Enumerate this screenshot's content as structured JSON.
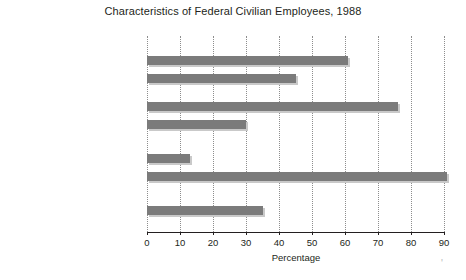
{
  "chart_data": {
    "type": "bar",
    "orientation": "horizontal",
    "title": "Characteristics of Federal Civilian Employees, 1988",
    "xlabel": "Percentage",
    "ylabel": "",
    "xlim": [
      0,
      90
    ],
    "xticks": [
      0,
      10,
      20,
      30,
      40,
      50,
      60,
      70,
      80,
      90
    ],
    "xtick_labels": [
      "0",
      "10",
      "20",
      "30",
      "40",
      "50",
      "60",
      "70",
      "80",
      "90"
    ],
    "grid": "vertical-dotted",
    "legend": "none",
    "categories": [
      "Male",
      "Female",
      "White",
      "Minority",
      "Located in Washington, D.C.",
      "Located Elsewhere",
      "College Graduates"
    ],
    "category_labels_html": [
      "Male",
      "Female",
      "White",
      "Minority<sup>a</sup>",
      "Located in Washington, D.C.",
      "Located Elsewhere",
      "College Graduates"
    ],
    "values": [
      61,
      45,
      76,
      30,
      13,
      91,
      35
    ],
    "footnote_marker": "a",
    "bar_color": "#7b7b7b",
    "bar_shadow_color": "#c9c9c9",
    "grid_color": "#8d8d8d",
    "text_color": "#231f20",
    "background_color": "#ffffff"
  }
}
